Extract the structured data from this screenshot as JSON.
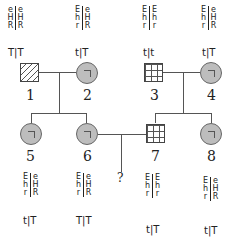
{
  "diagram": {
    "type": "pedigree",
    "individuals": [
      {
        "id": "1",
        "label": "1",
        "sex": "male",
        "fill": "hatched",
        "genotype": {
          "left": [
            "e",
            "H",
            "R"
          ],
          "right": [
            "e",
            "H",
            "R"
          ],
          "t": "T|T"
        }
      },
      {
        "id": "2",
        "label": "2",
        "sex": "female",
        "fill": "gray",
        "genotype": {
          "left": [
            "E",
            "h",
            "r"
          ],
          "right": [
            "e",
            "H",
            "R"
          ],
          "t": "t|T"
        }
      },
      {
        "id": "3",
        "label": "3",
        "sex": "male",
        "fill": "grid",
        "genotype": {
          "left": [
            "E",
            "h",
            "r"
          ],
          "right": [
            "E",
            "h",
            "r"
          ],
          "t": "t|t"
        }
      },
      {
        "id": "4",
        "label": "4",
        "sex": "female",
        "fill": "gray",
        "genotype": {
          "left": [
            "E",
            "h",
            "r"
          ],
          "right": [
            "e",
            "H",
            "R"
          ],
          "t": "t|T"
        }
      },
      {
        "id": "5",
        "label": "5",
        "sex": "female",
        "fill": "gray",
        "genotype": {
          "left": [
            "E",
            "h",
            "r"
          ],
          "right": [
            "e",
            "H",
            "R"
          ],
          "t": "t|T"
        }
      },
      {
        "id": "6",
        "label": "6",
        "sex": "female",
        "fill": "gray",
        "genotype": {
          "left": [
            "E",
            "h",
            "r"
          ],
          "right": [
            "e",
            "H",
            "R"
          ],
          "t": "T|T"
        }
      },
      {
        "id": "7",
        "label": "7",
        "sex": "male",
        "fill": "grid",
        "genotype": {
          "left": [
            "E",
            "h",
            "r"
          ],
          "right": [
            "E",
            "h",
            "r"
          ],
          "t": "t|T"
        }
      },
      {
        "id": "8",
        "label": "8",
        "sex": "female",
        "fill": "gray",
        "genotype": {
          "left": [
            "E",
            "h",
            "r"
          ],
          "right": [
            "e",
            "H",
            "R"
          ],
          "t": "t|T"
        }
      }
    ],
    "unknown_child": "?"
  }
}
